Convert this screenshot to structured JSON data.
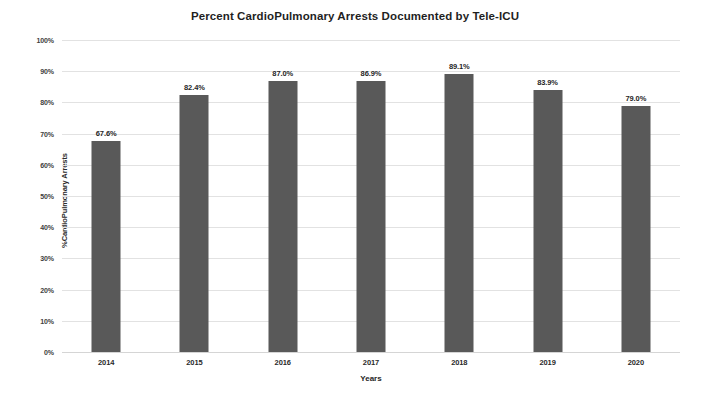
{
  "chart_data": {
    "type": "bar",
    "title": "Percent CardioPulmonary Arrests Documented by Tele-ICU",
    "xlabel": "Years",
    "ylabel": "%CardioPulmonary Arrests",
    "categories": [
      "2014",
      "2015",
      "2016",
      "2017",
      "2018",
      "2019",
      "2020"
    ],
    "values": [
      67.6,
      82.4,
      87.0,
      86.9,
      89.1,
      83.9,
      79.0
    ],
    "data_labels": [
      "67.6%",
      "82.4%",
      "87.0%",
      "86.9%",
      "89.1%",
      "83.9%",
      "79.0%"
    ],
    "ylim": [
      0,
      100
    ],
    "ytick_values": [
      0,
      10,
      20,
      30,
      40,
      50,
      60,
      70,
      80,
      90,
      100
    ],
    "ytick_labels": [
      "0%",
      "10%",
      "20%",
      "30%",
      "40%",
      "50%",
      "60%",
      "70%",
      "80%",
      "90%",
      "100%"
    ],
    "grid": true,
    "legend": false,
    "series_color": "#595959",
    "gridline_color": "#e2e2e2",
    "background_color": "#ffffff"
  }
}
